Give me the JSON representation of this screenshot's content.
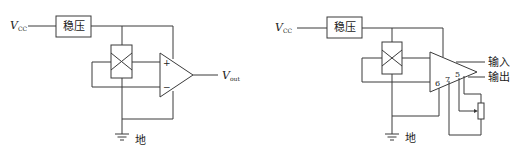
{
  "diagrams": [
    {
      "supply_label": "V",
      "supply_sub": "CC",
      "regulator_label": "稳压",
      "plus_label": "+",
      "minus_label": "−",
      "output_label": "V",
      "output_sub": "out",
      "ground_label": "地"
    },
    {
      "supply_label": "V",
      "supply_sub": "CC",
      "regulator_label": "稳压",
      "pin_labels": [
        "6",
        "7",
        "5"
      ],
      "input_label": "输入",
      "output_label": "输出",
      "ground_label": "地"
    }
  ],
  "colors": {
    "line": "#3a3a3a",
    "text": "#222222",
    "background": "#ffffff"
  }
}
